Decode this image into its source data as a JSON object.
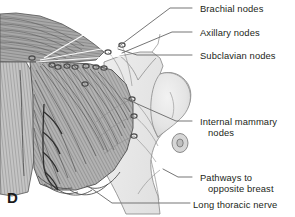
{
  "figure": {
    "panel_letter": "D",
    "background_color": "#ffffff",
    "text_color": "#231f20",
    "line_color": "#6e6e6e",
    "illustration": {
      "subject": "anatomical-illustration-breast-lymphatic-drainage",
      "tissue_fill_light": "#e9e9e9",
      "tissue_fill_mid": "#c9c9c9",
      "tissue_fill_dark": "#9a9a9a",
      "muscle_stroke": "#555555",
      "node_fill": "#4a4a4a",
      "skin_outline": "#7a7a7a"
    },
    "labels": [
      {
        "id": "brachial-nodes",
        "lines": [
          "Brachial nodes"
        ],
        "text_x": 200,
        "text_y": 3,
        "leader": [
          [
            192,
            8
          ],
          [
            170,
            8
          ],
          [
            118,
            47
          ]
        ]
      },
      {
        "id": "axillary-nodes",
        "lines": [
          "Axillary nodes"
        ],
        "text_x": 200,
        "text_y": 27,
        "leader": [
          [
            192,
            32
          ],
          [
            172,
            32
          ],
          [
            122,
            53
          ]
        ]
      },
      {
        "id": "subclavian-nodes",
        "lines": [
          "Subclavian nodes"
        ],
        "text_x": 200,
        "text_y": 50,
        "leader": [
          [
            192,
            55
          ],
          [
            137,
            55
          ],
          [
            118,
            49
          ]
        ]
      },
      {
        "id": "internal-mammary-nodes",
        "lines": [
          "Internal mammary",
          "nodes"
        ],
        "text_x": 200,
        "text_y": 116,
        "leader": [
          [
            192,
            121
          ],
          [
            176,
            121
          ],
          [
            124,
            98
          ]
        ]
      },
      {
        "id": "pathways-to-opposite-breast",
        "lines": [
          "Pathways to",
          "opposite breast"
        ],
        "text_x": 200,
        "text_y": 172,
        "leader": [
          [
            192,
            177
          ],
          [
            178,
            177
          ],
          [
            163,
            169
          ]
        ]
      },
      {
        "id": "long-thoracic-nerve",
        "lines": [
          "Long thoracic nerve"
        ],
        "text_x": 193,
        "text_y": 199,
        "leader": [
          [
            190,
            203
          ],
          [
            112,
            203
          ],
          [
            88,
            186
          ]
        ]
      }
    ],
    "lymph_nodes": [
      {
        "id": "node-axillary-1",
        "cx": 32,
        "cy": 58
      },
      {
        "id": "node-axillary-2",
        "cx": 52,
        "cy": 65
      },
      {
        "id": "node-axillary-3",
        "cx": 58,
        "cy": 67
      },
      {
        "id": "node-axillary-4",
        "cx": 67,
        "cy": 66
      },
      {
        "id": "node-axillary-5",
        "cx": 75,
        "cy": 67
      },
      {
        "id": "node-axillary-6",
        "cx": 86,
        "cy": 66
      },
      {
        "id": "node-axillary-7",
        "cx": 96,
        "cy": 67
      },
      {
        "id": "node-axillary-8",
        "cx": 104,
        "cy": 68
      },
      {
        "id": "node-central",
        "cx": 85,
        "cy": 84
      },
      {
        "id": "node-brachial-upper",
        "cx": 122,
        "cy": 45
      },
      {
        "id": "node-subclavian",
        "cx": 108,
        "cy": 52
      },
      {
        "id": "node-internal-mammary-1",
        "cx": 132,
        "cy": 99
      },
      {
        "id": "node-internal-mammary-2",
        "cx": 134,
        "cy": 116
      },
      {
        "id": "node-internal-mammary-3",
        "cx": 134,
        "cy": 136
      }
    ]
  }
}
